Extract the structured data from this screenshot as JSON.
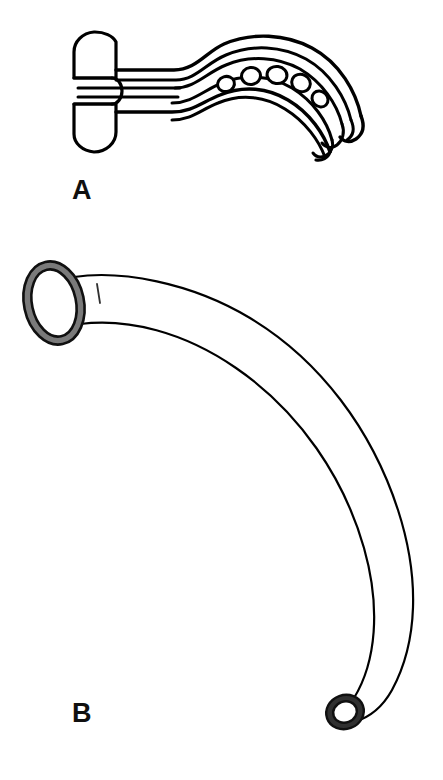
{
  "figure": {
    "kind": "medical-line-drawing",
    "background_color": "#ffffff",
    "ink_color": "#000000",
    "shade_color": "#7a7a7a",
    "panels": [
      {
        "id": "A",
        "label": "A",
        "label_position": {
          "x": 72,
          "y": 199
        },
        "device_name": "oropharyngeal-airway",
        "description": "Oropharyngeal (Guedel) airway shown in profile: flat oval bite-block flange at the left, a double-walled curved body, and five oval fenestrations along the inner channel toward the rounded distal tip.",
        "features": {
          "flange": {
            "name": "bite-block-flange",
            "shape": "rounded-oval-with-central-notch",
            "bounds": {
              "x": 73,
              "y": 32,
              "width": 60,
              "height": 120
            }
          },
          "body": {
            "name": "curved-double-wall-body",
            "wall_style": "double-line",
            "curve": "s-curve-descending-right"
          },
          "fenestrations": {
            "name": "oval-side-holes",
            "count": 5,
            "positions": [
              {
                "cx": 226,
                "cy": 84,
                "rx": 8,
                "ry": 7
              },
              {
                "cx": 251,
                "cy": 77,
                "rx": 9,
                "ry": 8
              },
              {
                "cx": 277,
                "cy": 75,
                "rx": 10,
                "ry": 8
              },
              {
                "cx": 301,
                "cy": 82,
                "rx": 9,
                "ry": 8
              },
              {
                "cx": 320,
                "cy": 96,
                "rx": 8,
                "ry": 7
              }
            ]
          },
          "tip": {
            "name": "rounded-distal-tip",
            "position": {
              "x": 352,
              "y": 118
            }
          }
        }
      },
      {
        "id": "B",
        "label": "B",
        "label_position": {
          "x": 72,
          "y": 722
        },
        "device_name": "nasopharyngeal-airway",
        "description": "Nasopharyngeal (nasal trumpet) airway: a wide flared proximal flange drawn as a shaded ring at the upper left, a long smooth C-shaped tube sweeping right and down, terminating in a small shaded ring at the bevelled distal tip.",
        "features": {
          "flange": {
            "name": "flared-proximal-flange",
            "shape": "shaded-ellipse-ring",
            "center": {
              "cx": 54,
              "cy": 303
            },
            "rx": 28,
            "ry": 40,
            "ring_thickness": 8,
            "rotation_deg": -12
          },
          "shaft_mark": {
            "name": "shaft-tick-mark",
            "from": {
              "x": 97,
              "y": 285
            },
            "to": {
              "x": 99,
              "y": 302
            }
          },
          "tube": {
            "name": "curved-tube-shaft",
            "curve": "c-curve-clockwise",
            "outer_extent_x": 425,
            "line_width": 2
          },
          "tip": {
            "name": "distal-ring-tip",
            "shape": "shaded-ring",
            "center": {
              "cx": 345,
              "cy": 712
            },
            "rx": 17,
            "ry": 15,
            "ring_thickness": 6
          }
        }
      }
    ]
  }
}
